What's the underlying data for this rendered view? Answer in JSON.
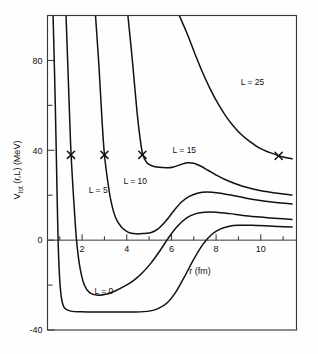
{
  "chart_data": {
    "type": "line",
    "title": "",
    "xlabel": "r (fm)",
    "ylabel": "V_tot (r,L)  (MeV)",
    "ylabel_main": "V",
    "ylabel_sub": "tot",
    "ylabel_rest": "(r,L)  (MeV)",
    "xlim": [
      0.45,
      11.6
    ],
    "ylim": [
      -40,
      100
    ],
    "grid": false,
    "legend": "inline-curve-labels",
    "xticks": [
      2,
      4,
      6,
      8,
      10
    ],
    "xtick_labels": [
      "2",
      "4",
      "6",
      "8",
      "10"
    ],
    "xminor_ticks": [
      1,
      3,
      5,
      7,
      9,
      11
    ],
    "yticks": [
      80,
      40,
      0,
      -40
    ],
    "ytick_labels": [
      "80",
      "40",
      "0",
      "-40"
    ],
    "yminor_ticks": [
      60,
      20,
      -20
    ],
    "series": [
      {
        "name": "L = 0",
        "label": "L = 0",
        "label_r": 2.55,
        "label_v": -24.0,
        "points": [
          [
            0.7,
            100
          ],
          [
            0.8,
            60
          ],
          [
            0.88,
            20
          ],
          [
            0.95,
            -8
          ],
          [
            1.05,
            -24
          ],
          [
            1.2,
            -30
          ],
          [
            1.5,
            -31.6
          ],
          [
            2.0,
            -31.9
          ],
          [
            2.6,
            -32.0
          ],
          [
            3.2,
            -32.0
          ],
          [
            3.8,
            -32.0
          ],
          [
            4.4,
            -32.0
          ],
          [
            5.0,
            -31.6
          ],
          [
            5.4,
            -30.5
          ],
          [
            5.8,
            -28.0
          ],
          [
            6.2,
            -23.0
          ],
          [
            6.6,
            -16.0
          ],
          [
            7.0,
            -8.5
          ],
          [
            7.4,
            -2.0
          ],
          [
            7.8,
            2.5
          ],
          [
            8.2,
            5.0
          ],
          [
            8.6,
            6.2
          ],
          [
            9.0,
            6.6
          ],
          [
            9.6,
            6.6
          ],
          [
            10.2,
            6.4
          ],
          [
            10.8,
            6.1
          ],
          [
            11.4,
            5.8
          ]
        ]
      },
      {
        "name": "L = 5",
        "label": "L = 5",
        "label_r": 2.3,
        "label_v": 21.0,
        "xmark_r": 1.5,
        "xmark_v": 38.0,
        "points": [
          [
            1.28,
            100
          ],
          [
            1.38,
            72
          ],
          [
            1.48,
            44
          ],
          [
            1.55,
            30
          ],
          [
            1.65,
            14
          ],
          [
            1.75,
            0
          ],
          [
            1.9,
            -12
          ],
          [
            2.1,
            -20
          ],
          [
            2.35,
            -23.5
          ],
          [
            2.7,
            -24.5
          ],
          [
            3.1,
            -24.0
          ],
          [
            3.5,
            -22.5
          ],
          [
            3.9,
            -20.5
          ],
          [
            4.3,
            -18.0
          ],
          [
            4.7,
            -14.5
          ],
          [
            5.1,
            -10.0
          ],
          [
            5.5,
            -4.5
          ],
          [
            5.9,
            1.5
          ],
          [
            6.3,
            6.5
          ],
          [
            6.7,
            10.0
          ],
          [
            7.1,
            11.8
          ],
          [
            7.5,
            12.4
          ],
          [
            8.0,
            12.4
          ],
          [
            8.6,
            11.8
          ],
          [
            9.2,
            11.0
          ],
          [
            9.8,
            10.4
          ],
          [
            10.4,
            9.9
          ],
          [
            11.0,
            9.5
          ],
          [
            11.4,
            9.2
          ]
        ]
      },
      {
        "name": "L = 10",
        "label": "L = 10",
        "label_r": 3.85,
        "label_v": 25.0,
        "xmark_r": 3.0,
        "xmark_v": 38.0,
        "points": [
          [
            2.6,
            100
          ],
          [
            2.75,
            78
          ],
          [
            2.9,
            52
          ],
          [
            3.0,
            38
          ],
          [
            3.15,
            26
          ],
          [
            3.3,
            17
          ],
          [
            3.5,
            10
          ],
          [
            3.75,
            6.0
          ],
          [
            4.05,
            3.6
          ],
          [
            4.4,
            2.8
          ],
          [
            4.8,
            3.0
          ],
          [
            5.1,
            3.4
          ],
          [
            5.4,
            5.0
          ],
          [
            5.75,
            8.5
          ],
          [
            6.1,
            13.0
          ],
          [
            6.45,
            17.0
          ],
          [
            6.8,
            19.5
          ],
          [
            7.2,
            21.0
          ],
          [
            7.6,
            21.4
          ],
          [
            8.1,
            21.0
          ],
          [
            8.7,
            20.0
          ],
          [
            9.3,
            18.8
          ],
          [
            9.9,
            17.8
          ],
          [
            10.5,
            17.0
          ],
          [
            11.1,
            16.4
          ],
          [
            11.4,
            16.1
          ]
        ]
      },
      {
        "name": "L = 15",
        "label": "L = 15",
        "label_r": 6.05,
        "label_v": 39.0,
        "xmark_r": 4.7,
        "xmark_v": 38.0,
        "points": [
          [
            4.05,
            100
          ],
          [
            4.25,
            80
          ],
          [
            4.45,
            58
          ],
          [
            4.6,
            45
          ],
          [
            4.72,
            38
          ],
          [
            4.9,
            34.5
          ],
          [
            5.15,
            33.0
          ],
          [
            5.45,
            32.4
          ],
          [
            5.8,
            32.2
          ],
          [
            6.1,
            32.6
          ],
          [
            6.4,
            33.6
          ],
          [
            6.7,
            34.4
          ],
          [
            7.0,
            34.2
          ],
          [
            7.3,
            33.0
          ],
          [
            7.65,
            31.0
          ],
          [
            8.0,
            29.0
          ],
          [
            8.4,
            27.0
          ],
          [
            8.9,
            25.0
          ],
          [
            9.4,
            23.4
          ],
          [
            9.9,
            22.2
          ],
          [
            10.5,
            21.2
          ],
          [
            11.1,
            20.4
          ],
          [
            11.4,
            20.1
          ]
        ]
      },
      {
        "name": "L = 25",
        "label": "L = 25",
        "label_r": 9.1,
        "label_v": 69.0,
        "xmark_r": 10.8,
        "xmark_v": 37.5,
        "points": [
          [
            6.35,
            100
          ],
          [
            6.7,
            92
          ],
          [
            7.05,
            83
          ],
          [
            7.4,
            74.5
          ],
          [
            7.75,
            67.0
          ],
          [
            8.1,
            60.5
          ],
          [
            8.45,
            55.0
          ],
          [
            8.8,
            50.5
          ],
          [
            9.15,
            46.8
          ],
          [
            9.5,
            44.0
          ],
          [
            9.85,
            41.5
          ],
          [
            10.2,
            39.8
          ],
          [
            10.55,
            38.5
          ],
          [
            10.8,
            37.6
          ],
          [
            11.1,
            36.8
          ],
          [
            11.4,
            36.2
          ]
        ]
      }
    ]
  },
  "axis": {
    "x_title": "r (fm)",
    "y_title_main": "V",
    "y_title_sub": "tot",
    "y_title_rest": "(r,L)  (MeV)"
  }
}
